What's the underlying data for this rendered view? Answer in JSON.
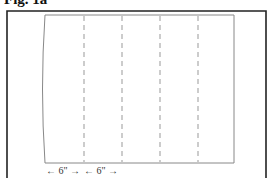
{
  "figure": {
    "title": "Fig. 1a",
    "dimensions": [
      {
        "label": "← 6\" →"
      },
      {
        "label": "← 6\" →"
      }
    ],
    "fold_lines": {
      "count": 4,
      "style": "dashed"
    },
    "colors": {
      "frame": "#222222",
      "panel": "#888888",
      "fold": "#999999"
    }
  }
}
